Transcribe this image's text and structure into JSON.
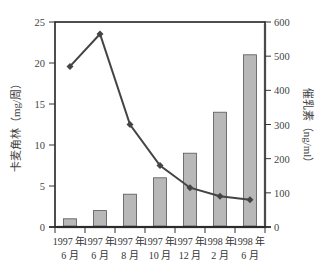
{
  "chart_data": {
    "type": "bar+line",
    "title": "",
    "categories": [
      {
        "line1": "1997 年",
        "line2": "6 月"
      },
      {
        "line1": "1997 年",
        "line2": "6 月"
      },
      {
        "line1": "1997 年",
        "line2": "8 月"
      },
      {
        "line1": "1997 年",
        "line2": "10 月"
      },
      {
        "line1": "1997 年",
        "line2": "12 月"
      },
      {
        "line1": "1998 年",
        "line2": "2 月"
      },
      {
        "line1": "1998 年",
        "line2": "6 月"
      }
    ],
    "series": [
      {
        "name": "卡麦角林",
        "type": "bar",
        "axis": "left",
        "values": [
          1,
          2,
          4,
          6,
          9,
          14,
          21
        ],
        "color": "#b8b8b8"
      },
      {
        "name": "催乳素",
        "type": "line",
        "axis": "right",
        "values": [
          470,
          565,
          300,
          180,
          115,
          90,
          80
        ],
        "color": "#444444"
      }
    ],
    "left_axis": {
      "label": "卡麦角林（mg/周）",
      "ticks": [
        0,
        5,
        10,
        15,
        20,
        25
      ],
      "ylim": [
        0,
        25
      ],
      "label_color": "#444444"
    },
    "right_axis": {
      "label": "催乳素（ng/ml）",
      "ticks": [
        0,
        100,
        200,
        300,
        400,
        500,
        600
      ],
      "ylim": [
        0,
        600
      ]
    },
    "xlabel": "",
    "grid": false,
    "legend": null
  }
}
